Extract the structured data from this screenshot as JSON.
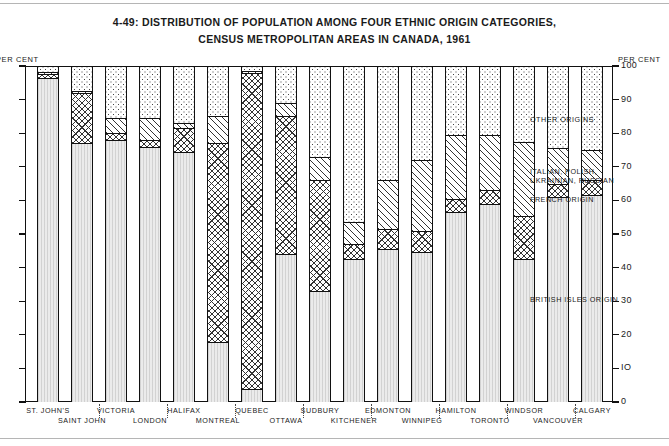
{
  "title": {
    "line1": "4-49: DISTRIBUTION OF POPULATION AMONG FOUR ETHNIC ORIGIN CATEGORIES,",
    "line2": "CENSUS METROPOLITAN AREAS IN CANADA, 1961"
  },
  "axis": {
    "left_caption": "PER CENT",
    "right_caption": "PER CENT",
    "ticks": [
      "100",
      "90",
      "80",
      "70",
      "60",
      "50",
      "40",
      "30",
      "20",
      "10",
      "0"
    ]
  },
  "legend": [
    {
      "key": "other",
      "label": "OTHER ORIGINS"
    },
    {
      "key": "italian",
      "label": "ITALIAN, POLISH,"
    },
    {
      "key": "italian2",
      "label": "UKRAINIAN, RUSSIAN"
    },
    {
      "key": "french",
      "label": "FRENCH ORIGIN"
    },
    {
      "key": "british",
      "label": "BRITISH ISLES ORIGIN"
    }
  ],
  "chart_data": {
    "type": "bar",
    "title": "4-49: DISTRIBUTION OF POPULATION AMONG FOUR ETHNIC ORIGIN CATEGORIES, CENSUS METROPOLITAN AREAS IN CANADA, 1961",
    "xlabel": "",
    "ylabel": "PER CENT",
    "ylim": [
      0,
      100
    ],
    "yticks": [
      0,
      10,
      20,
      30,
      40,
      50,
      60,
      70,
      80,
      90,
      100
    ],
    "grid": false,
    "stacked": true,
    "legend_position": "right",
    "categories": [
      "ST. JOHN'S",
      "SAINT JOHN",
      "VICTORIA",
      "LONDON",
      "HALIFAX",
      "MONTREAL",
      "QUEBEC",
      "OTTAWA",
      "SUDBURY",
      "KITCHENER",
      "EDMONTON",
      "WINNIPEG",
      "HAMILTON",
      "TORONTO",
      "WINDSOR",
      "VANCOUVER",
      "CALGARY"
    ],
    "series": [
      {
        "name": "BRITISH ISLES ORIGIN",
        "key": "british",
        "values": [
          96.5,
          77.0,
          78.0,
          76.0,
          74.5,
          18.0,
          4.0,
          44.0,
          33.0,
          42.5,
          45.5,
          44.5,
          56.5,
          59.0,
          42.5,
          61.0,
          61.5
        ]
      },
      {
        "name": "FRENCH ORIGIN",
        "key": "french",
        "values": [
          1.2,
          15.0,
          2.0,
          2.0,
          7.0,
          59.0,
          94.0,
          41.0,
          33.0,
          4.5,
          6.0,
          6.5,
          4.0,
          4.0,
          13.0,
          4.0,
          4.5
        ]
      },
      {
        "name": "ITALIAN, POLISH, UKRAINIAN, RUSSIAN",
        "key": "italian",
        "values": [
          0.5,
          0.5,
          4.5,
          6.5,
          1.5,
          8.0,
          0.5,
          4.0,
          7.0,
          6.5,
          14.5,
          21.0,
          19.0,
          16.5,
          22.0,
          10.5,
          9.0
        ]
      },
      {
        "name": "OTHER ORIGINS",
        "key": "other",
        "values": [
          1.8,
          7.5,
          15.5,
          15.5,
          17.0,
          15.0,
          1.5,
          11.0,
          27.0,
          46.5,
          34.0,
          28.0,
          20.5,
          20.5,
          22.5,
          24.5,
          25.0
        ]
      }
    ]
  },
  "xaxis_rows": {
    "row1": [
      "ST. JOHN'S",
      "VICTORIA",
      "HALIFAX",
      "QUEBEC",
      "SUDBURY",
      "EDMONTON",
      "HAMILTON",
      "WINDSOR",
      "CALGARY"
    ],
    "row2": [
      "SAINT JOHN",
      "LONDON",
      "MONTREAL",
      "OTTAWA",
      "KITCHENER",
      "WINNIPEG",
      "TORONTO",
      "VANCOUVER"
    ]
  }
}
